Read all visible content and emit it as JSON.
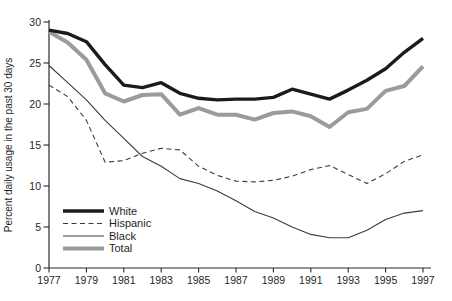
{
  "figure": {
    "background": "#ffffff",
    "text_color": "#1f1f1f"
  },
  "chart_data": {
    "type": "line",
    "title": "",
    "xlabel": "",
    "ylabel": "Percent daily usage in the past 30 days",
    "x": [
      1977,
      1978,
      1979,
      1980,
      1981,
      1982,
      1983,
      1984,
      1985,
      1986,
      1987,
      1988,
      1989,
      1990,
      1991,
      1992,
      1993,
      1994,
      1995,
      1996,
      1997
    ],
    "x_tick_labels": [
      "1977",
      "1979",
      "1981",
      "1983",
      "1985",
      "1987",
      "1989",
      "1991",
      "1993",
      "1995",
      "1997"
    ],
    "xlim": [
      1977,
      1997
    ],
    "ylim": [
      0,
      30
    ],
    "yticks": [
      0,
      5,
      10,
      15,
      20,
      25,
      30
    ],
    "grid": false,
    "legend_position": "lower-left",
    "legend_entries": [
      "White",
      "Hispanic",
      "Black",
      "Total"
    ],
    "series": [
      {
        "name": "White",
        "color": "#1b1b1b",
        "width": 3.4,
        "dash": "",
        "values": [
          29.0,
          28.6,
          27.6,
          24.8,
          22.3,
          22.0,
          22.6,
          21.3,
          20.7,
          20.5,
          20.6,
          20.6,
          20.8,
          21.8,
          21.2,
          20.6,
          21.7,
          22.9,
          24.3,
          26.3,
          28.0
        ]
      },
      {
        "name": "Hispanic",
        "color": "#3c3c3c",
        "width": 1.1,
        "dash": "5,3.5",
        "values": [
          22.3,
          20.9,
          18.0,
          12.9,
          13.1,
          14.0,
          14.6,
          14.4,
          12.4,
          11.3,
          10.6,
          10.5,
          10.7,
          11.2,
          12.0,
          12.5,
          11.4,
          10.3,
          11.5,
          13.0,
          13.8
        ]
      },
      {
        "name": "Black",
        "color": "#3c3c3c",
        "width": 1.1,
        "dash": "",
        "values": [
          24.7,
          22.6,
          20.5,
          18.0,
          15.8,
          13.6,
          12.4,
          10.9,
          10.3,
          9.4,
          8.2,
          6.9,
          6.1,
          5.0,
          4.1,
          3.7,
          3.7,
          4.6,
          5.9,
          6.7,
          7.0
        ]
      },
      {
        "name": "Total",
        "color": "#9b9b9b",
        "width": 4.0,
        "dash": "",
        "values": [
          28.8,
          27.5,
          25.4,
          21.3,
          20.3,
          21.1,
          21.2,
          18.7,
          19.5,
          18.7,
          18.7,
          18.1,
          18.9,
          19.1,
          18.5,
          17.2,
          19.0,
          19.4,
          21.6,
          22.2,
          24.6
        ]
      }
    ]
  }
}
